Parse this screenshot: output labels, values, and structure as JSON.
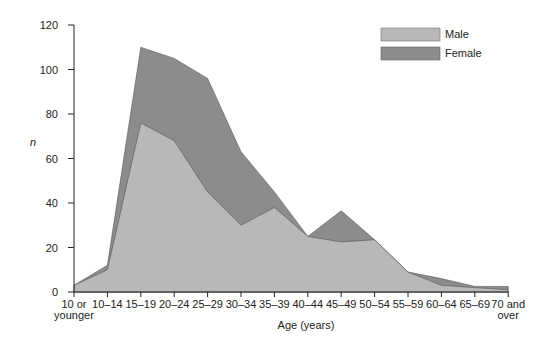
{
  "chart_data": {
    "type": "area",
    "stacked": true,
    "title": "",
    "xlabel": "Age (years)",
    "ylabel": "n",
    "ylim": [
      0,
      120
    ],
    "yticks": [
      0,
      20,
      40,
      60,
      80,
      100,
      120
    ],
    "grid": false,
    "legend_position": "top-right",
    "categories": [
      "10 or younger",
      "10–14",
      "15–19",
      "20–24",
      "25–29",
      "30–34",
      "35–39",
      "40–44",
      "45–49",
      "50–54",
      "55–59",
      "60–64",
      "65–69",
      "70 and over"
    ],
    "series": [
      {
        "name": "Male",
        "color": "#b8b8b8",
        "values": [
          3,
          10,
          76,
          68,
          45,
          30,
          38,
          25,
          22.5,
          23.5,
          9,
          3,
          2,
          1
        ]
      },
      {
        "name": "Female (total)",
        "color": "#8c8c8c",
        "values": [
          3,
          12,
          110,
          105,
          96,
          63,
          45,
          25,
          36.5,
          23.5,
          9,
          6,
          2.5,
          2.5
        ]
      }
    ],
    "legend": [
      "Male",
      "Female"
    ]
  },
  "axis": {
    "y_label": "n",
    "x_label": "Age (years)",
    "y_ticks": [
      "0",
      "20",
      "40",
      "60",
      "80",
      "100",
      "120"
    ],
    "x_ticks": [
      {
        "line1": "10 or",
        "line2": "younger"
      },
      {
        "line1": "10–14",
        "line2": ""
      },
      {
        "line1": "15–19",
        "line2": ""
      },
      {
        "line1": "20–24",
        "line2": ""
      },
      {
        "line1": "25–29",
        "line2": ""
      },
      {
        "line1": "30–34",
        "line2": ""
      },
      {
        "line1": "35–39",
        "line2": ""
      },
      {
        "line1": "40–44",
        "line2": ""
      },
      {
        "line1": "45–49",
        "line2": ""
      },
      {
        "line1": "50–54",
        "line2": ""
      },
      {
        "line1": "55–59",
        "line2": ""
      },
      {
        "line1": "60–64",
        "line2": ""
      },
      {
        "line1": "65–69",
        "line2": ""
      },
      {
        "line1": "70 and",
        "line2": "over"
      }
    ]
  },
  "legend": {
    "male": {
      "label": "Male",
      "color": "#b8b8b8"
    },
    "female": {
      "label": "Female",
      "color": "#8c8c8c"
    }
  }
}
